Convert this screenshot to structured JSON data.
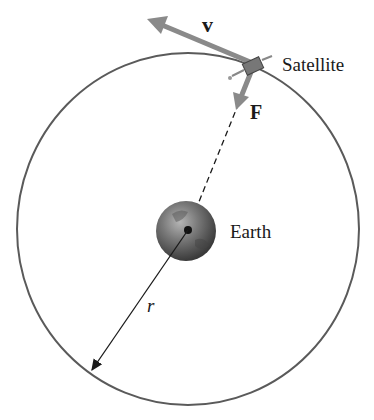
{
  "diagram": {
    "labels": {
      "velocity": "v",
      "force": "F",
      "satellite": "Satellite",
      "earth": "Earth",
      "radius": "r"
    },
    "colors": {
      "orbit": "#5a5a5a",
      "vector": "#8a8a8a",
      "earth_light": "#9a9a9a",
      "earth_dark": "#3a3a3a",
      "text": "#1a1a1a"
    },
    "geometry": {
      "orbit_center": [
        188,
        229
      ],
      "orbit_rx": 171,
      "orbit_ry": 176,
      "satellite_position": [
        252,
        67
      ],
      "earth_radius": 30
    }
  }
}
